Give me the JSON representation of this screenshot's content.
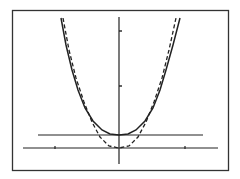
{
  "chart_data": {
    "type": "line",
    "title": "",
    "xlabel": "",
    "ylabel": "",
    "grid": false,
    "legend": null,
    "frame": true,
    "axes": {
      "x_axis_y_pixel": 148,
      "y_axis_x_pixel": 119,
      "x_ticks_pixel": [
        55,
        185
      ],
      "y_ticks_pixel": [
        31,
        86
      ]
    },
    "series": [
      {
        "name": "solid-curve",
        "style": "solid",
        "description": "U-shaped even-power curve, minimum at y=1 (touches horizontal line y=1)",
        "vertex": [
          0,
          1
        ],
        "points_pixel": [
          [
            61,
            18
          ],
          [
            66,
            45
          ],
          [
            72,
            70
          ],
          [
            78,
            90
          ],
          [
            85,
            108
          ],
          [
            93,
            121
          ],
          [
            102,
            130
          ],
          [
            110,
            134
          ],
          [
            119,
            135
          ],
          [
            128,
            134
          ],
          [
            136,
            130
          ],
          [
            145,
            121
          ],
          [
            153,
            108
          ],
          [
            160,
            90
          ],
          [
            166,
            70
          ],
          [
            173,
            45
          ],
          [
            180,
            18
          ]
        ]
      },
      {
        "name": "dashed-curve",
        "style": "dashed",
        "description": "Steeper U-shaped curve with minimum at origin",
        "vertex": [
          0,
          0
        ],
        "points_pixel": [
          [
            63,
            18
          ],
          [
            69,
            50
          ],
          [
            76,
            78
          ],
          [
            84,
            102
          ],
          [
            92,
            122
          ],
          [
            100,
            137
          ],
          [
            109,
            146
          ],
          [
            119,
            148
          ],
          [
            129,
            146
          ],
          [
            138,
            137
          ],
          [
            146,
            122
          ],
          [
            154,
            102
          ],
          [
            162,
            78
          ],
          [
            169,
            50
          ],
          [
            176,
            18
          ]
        ]
      },
      {
        "name": "horizontal-line",
        "style": "solid",
        "description": "Horizontal line y = 1",
        "points_pixel": [
          [
            38,
            135
          ],
          [
            203,
            135
          ]
        ]
      }
    ],
    "colors": {
      "line": "#222222",
      "frame": "#333333",
      "background": "#ffffff"
    }
  }
}
